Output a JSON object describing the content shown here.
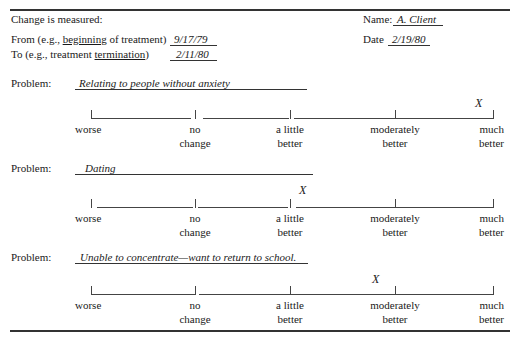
{
  "header": {
    "change_measured_label": "Change is measured:",
    "from_prefix": "From (e.g., ",
    "from_underlined": "beginning",
    "from_suffix": " of treatment)",
    "from_value": "9/17/79",
    "to_prefix": "To (e.g., treatment ",
    "to_underlined": "termination",
    "to_suffix": ")",
    "to_value": "2/11/80",
    "name_label": "Name:",
    "name_value": "A. Client",
    "date_label": "Date",
    "date_value": "2/19/80"
  },
  "scale_labels": {
    "worse": "worse",
    "no_change_1": "no",
    "no_change_2": "change",
    "little_1": "a little",
    "little_2": "better",
    "moderately_1": "moderately",
    "moderately_2": "better",
    "much_1": "much",
    "much_2": "better"
  },
  "problems": [
    {
      "label": "Problem:",
      "text": "Relating to people without anxiety",
      "rating": "much better",
      "mark": "X"
    },
    {
      "label": "Problem:",
      "text": "Dating",
      "rating": "a little better",
      "mark": "X"
    },
    {
      "label": "Problem:",
      "text": "Unable to concentrate—want to return to school.",
      "rating": "between a little better and moderately better",
      "mark": "X"
    }
  ]
}
